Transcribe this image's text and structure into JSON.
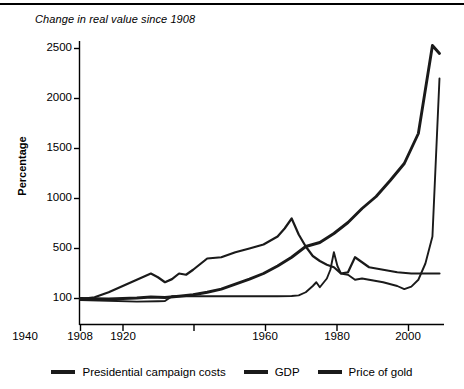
{
  "chart_data": {
    "type": "line",
    "title": "Change in real value since 1908",
    "xlabel": "",
    "ylabel": "Percentage",
    "xlim": [
      1908,
      2011
    ],
    "ylim": [
      0,
      2500
    ],
    "grid": false,
    "legend_position": "bottom",
    "xticks": [
      1908,
      1920,
      1940,
      1960,
      1980,
      2000
    ],
    "xtick_labels": [
      "1908",
      "1920",
      "1940",
      "1960",
      "1980",
      "2000"
    ],
    "yticks": [
      100,
      500,
      1000,
      1500,
      2000,
      2500
    ],
    "ytick_labels": [
      "100",
      "500",
      "1000",
      "1500",
      "2000",
      "2500"
    ],
    "series": [
      {
        "name": "Presidential campaign costs",
        "color": "#1a1a1a",
        "x": [
          1908,
          1912,
          1916,
          1920,
          1924,
          1928,
          1932,
          1936,
          1940,
          1944,
          1948,
          1952,
          1956,
          1960,
          1964,
          1968,
          1972,
          1976,
          1980,
          1984,
          1988,
          1992,
          1996,
          2000,
          2004,
          2008,
          2010
        ],
        "values": [
          100,
          98,
          96,
          100,
          104,
          112,
          108,
          118,
          130,
          150,
          175,
          215,
          255,
          300,
          360,
          430,
          520,
          560,
          650,
          760,
          900,
          1020,
          1180,
          1350,
          1650,
          2530,
          2450
        ]
      },
      {
        "name": "GDP",
        "color": "#1a1a1a",
        "x": [
          1908,
          1912,
          1916,
          1920,
          1924,
          1928,
          1930,
          1932,
          1934,
          1936,
          1938,
          1940,
          1944,
          1948,
          1952,
          1956,
          1960,
          1964,
          1966,
          1968,
          1970,
          1972,
          1974,
          1976,
          1978,
          1980,
          1982,
          1984,
          1986,
          1988,
          1990,
          1994,
          1998,
          2002,
          2006,
          2010
        ],
        "values": [
          95,
          110,
          150,
          200,
          250,
          300,
          270,
          230,
          255,
          300,
          290,
          330,
          420,
          430,
          470,
          500,
          540,
          620,
          700,
          800,
          640,
          520,
          440,
          400,
          370,
          350,
          300,
          310,
          430,
          390,
          350,
          330,
          310,
          300,
          300,
          300
        ]
      },
      {
        "name": "Price of gold",
        "color": "#1a1a1a",
        "x": [
          1908,
          1916,
          1924,
          1930,
          1932,
          1934,
          1936,
          1940,
          1944,
          1950,
          1956,
          1960,
          1964,
          1968,
          1970,
          1972,
          1974,
          1975,
          1976,
          1978,
          1979,
          1980,
          1981,
          1982,
          1984,
          1986,
          1988,
          1990,
          1994,
          1998,
          2000,
          2002,
          2004,
          2006,
          2008,
          2010
        ],
        "values": [
          88,
          82,
          75,
          78,
          80,
          118,
          118,
          118,
          118,
          118,
          118,
          118,
          118,
          120,
          125,
          150,
          200,
          230,
          190,
          260,
          330,
          470,
          360,
          300,
          290,
          250,
          260,
          250,
          230,
          200,
          175,
          195,
          250,
          380,
          620,
          2200
        ]
      }
    ],
    "annotations": []
  },
  "legend": {
    "items": [
      {
        "label": "Presidential campaign costs"
      },
      {
        "label": "GDP"
      },
      {
        "label": "Price of gold"
      }
    ]
  }
}
